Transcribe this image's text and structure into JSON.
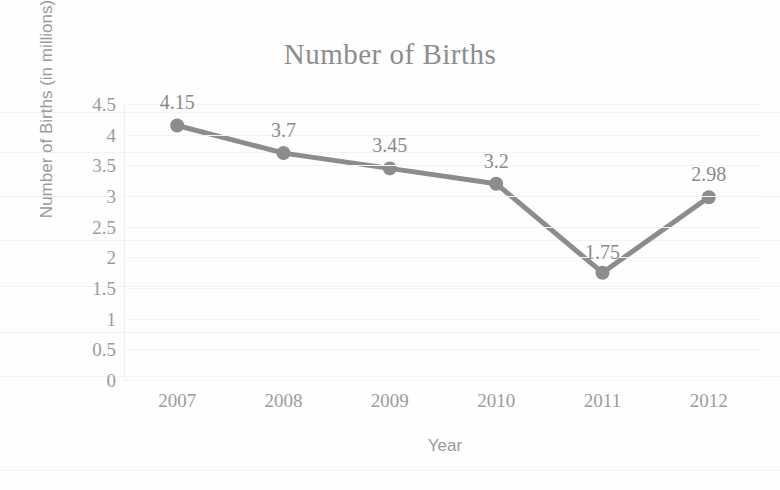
{
  "chart_data": {
    "type": "line",
    "title": "Number of Births",
    "xlabel": "Year",
    "ylabel": "Number of Births (in millions)",
    "categories": [
      "2007",
      "2008",
      "2009",
      "2010",
      "2011",
      "2012"
    ],
    "values": [
      4.15,
      3.7,
      3.45,
      3.2,
      1.75,
      2.98
    ],
    "data_labels": [
      "4.15",
      "3.7",
      "3.45",
      "3.2",
      "1.75",
      "2.98"
    ],
    "ylim": [
      0,
      4.5
    ],
    "ytick_labels": [
      "4.5",
      "4",
      "3.5",
      "3",
      "2.5",
      "2",
      "1.5",
      "1",
      "0.5",
      "0"
    ],
    "ytick_values": [
      4.5,
      4,
      3.5,
      3,
      2.5,
      2,
      1.5,
      1,
      0.5,
      0
    ],
    "grid": true,
    "legend": false,
    "series_color": "#8c8c8c",
    "marker": "circle",
    "text_color": "#9c9c9c",
    "title_color": "#8d8d8d",
    "background": "#fefefe"
  }
}
